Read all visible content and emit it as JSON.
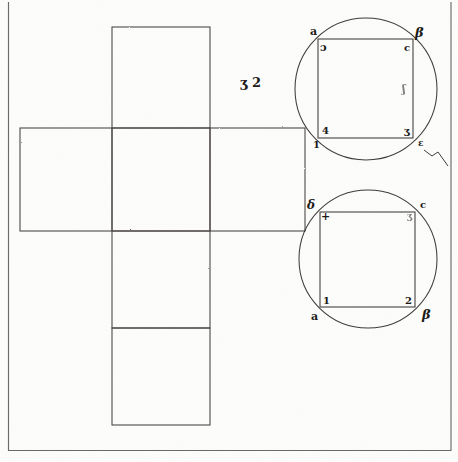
{
  "plate": {
    "title": "Cube net with two circumscribed circles",
    "background_color": "#fdfdfc",
    "ink_color": "#2a2724",
    "frame": {
      "name": "plate-border",
      "left_x": 8,
      "right_x": 451,
      "bottom_y": 450,
      "top_y": 2
    }
  },
  "center_note": {
    "text": "ʒ 2"
  },
  "net": {
    "label": "cube-net",
    "squares": [
      {
        "name": "net-square-top",
        "x": 112,
        "y": 27,
        "w": 98,
        "h": 101
      },
      {
        "name": "net-square-left",
        "x": 20,
        "y": 128,
        "w": 92,
        "h": 103
      },
      {
        "name": "net-square-center",
        "x": 112,
        "y": 128,
        "w": 98,
        "h": 103
      },
      {
        "name": "net-square-right",
        "x": 210,
        "y": 128,
        "w": 95,
        "h": 103
      },
      {
        "name": "net-square-lower",
        "x": 112,
        "y": 231,
        "w": 98,
        "h": 97
      },
      {
        "name": "net-square-bottom",
        "x": 112,
        "y": 328,
        "w": 98,
        "h": 97
      }
    ]
  },
  "figures": [
    {
      "name": "upper-circle-figure",
      "circle": {
        "cx": 366,
        "cy": 89,
        "r": 71
      },
      "square": {
        "x": 318,
        "y": 39,
        "w": 95,
        "h": 99
      },
      "labels": [
        {
          "name": "label-upper-a",
          "text": "a",
          "style": "latin",
          "size": 11,
          "x": 310,
          "y": 26,
          "faint": false
        },
        {
          "name": "label-upper-d",
          "text": "ɔ",
          "style": "latin",
          "size": 11,
          "x": 320,
          "y": 42,
          "faint": false
        },
        {
          "name": "label-upper-beta",
          "text": "β",
          "style": "greek",
          "size": 13,
          "x": 415,
          "y": 26,
          "faint": false
        },
        {
          "name": "label-upper-c",
          "text": "c",
          "style": "latin",
          "size": 10,
          "x": 404,
          "y": 43,
          "faint": false
        },
        {
          "name": "label-upper-four",
          "text": "4",
          "style": "num",
          "size": 10,
          "x": 322,
          "y": 126,
          "faint": false
        },
        {
          "name": "label-upper-one",
          "text": "1",
          "style": "num",
          "size": 10,
          "x": 313,
          "y": 140,
          "faint": false
        },
        {
          "name": "label-upper-three",
          "text": "ʒ",
          "style": "num",
          "size": 10,
          "x": 404,
          "y": 126,
          "faint": false
        },
        {
          "name": "label-upper-mark",
          "text": "ɛ",
          "style": "latin",
          "size": 9,
          "x": 418,
          "y": 139,
          "faint": false
        },
        {
          "name": "label-upper-faint-edge",
          "text": "ʃ",
          "style": "latin",
          "size": 11,
          "x": 402,
          "y": 84,
          "faint": true
        }
      ],
      "flourish": {
        "name": "pen-flourish",
        "path": "M 424 150 L 432 156 L 438 152 L 448 166"
      }
    },
    {
      "name": "lower-circle-figure",
      "circle": {
        "cx": 368,
        "cy": 259,
        "r": 69
      },
      "square": {
        "x": 320,
        "y": 212,
        "w": 95,
        "h": 95
      },
      "labels": [
        {
          "name": "label-lower-delta",
          "text": "δ",
          "style": "greek",
          "size": 12,
          "x": 307,
          "y": 199,
          "faint": false
        },
        {
          "name": "label-lower-plus",
          "text": "+",
          "style": "num",
          "size": 11,
          "x": 321,
          "y": 211,
          "faint": false
        },
        {
          "name": "label-lower-c",
          "text": "c",
          "style": "latin",
          "size": 10,
          "x": 420,
          "y": 200,
          "faint": false
        },
        {
          "name": "label-lower-three",
          "text": "ʒ",
          "style": "num",
          "size": 9,
          "x": 407,
          "y": 212,
          "faint": true
        },
        {
          "name": "label-lower-one",
          "text": "1",
          "style": "num",
          "size": 10,
          "x": 323,
          "y": 296,
          "faint": false
        },
        {
          "name": "label-lower-a",
          "text": "a",
          "style": "latin",
          "size": 11,
          "x": 311,
          "y": 311,
          "faint": false
        },
        {
          "name": "label-lower-two",
          "text": "2",
          "style": "num",
          "size": 10,
          "x": 405,
          "y": 296,
          "faint": false
        },
        {
          "name": "label-lower-beta",
          "text": "β",
          "style": "greek",
          "size": 13,
          "x": 422,
          "y": 308,
          "faint": false
        }
      ]
    }
  ]
}
